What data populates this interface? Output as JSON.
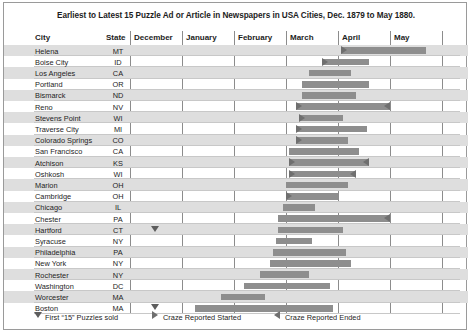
{
  "chart": {
    "title": "Earliest to Latest 15 Puzzle Ad or Article in Newspapers in USA Cities, Dec. 1879 to May 1880.",
    "columns": {
      "city": "City",
      "state": "State"
    },
    "months": [
      "December",
      "January",
      "February",
      "March",
      "April",
      "May"
    ]
  },
  "legend": [
    {
      "glyph": "triangle-down-icon",
      "label": "First “15” Puzzles sold"
    },
    {
      "glyph": "triangle-right-icon",
      "label": "Craze Reported Started"
    },
    {
      "glyph": "triangle-left-icon",
      "label": "Craze Reported Ended"
    }
  ],
  "chart_data": {
    "type": "bar",
    "orientation": "horizontal",
    "subtype": "gantt-timeline",
    "title": "Earliest to Latest 15 Puzzle Ad or Article in Newspapers in USA Cities, Dec. 1879 to May 1880.",
    "xlabel": "",
    "ylabel": "City",
    "x_axis_categories": [
      "December",
      "January",
      "February",
      "March",
      "April",
      "May"
    ],
    "x_axis_range_months": [
      "1879-12",
      "1880-05"
    ],
    "grid": true,
    "legend_position": "bottom-left",
    "value_units": "months (fractional, 0 = start of December 1879)",
    "markers": {
      "triangle_down": "First “15” Puzzles sold",
      "triangle_right": "Craze Reported Started",
      "triangle_left": "Craze Reported Ended"
    },
    "categories": [
      "Helena",
      "Boise City",
      "Los Angeles",
      "Portland",
      "Bismarck",
      "Reno",
      "Stevens Point",
      "Traverse City",
      "Colorado Springs",
      "San Francisco",
      "Atchison",
      "Oshkosh",
      "Marion",
      "Cambridge",
      "Chicago",
      "Chester",
      "Hartford",
      "Syracuse",
      "Philadelphia",
      "New York",
      "Rochester",
      "Washington",
      "Worcester",
      "Boston"
    ],
    "rows": [
      {
        "city": "Helena",
        "state": "MT",
        "start": 4.05,
        "end": 5.7,
        "start_marker": "triangle-right",
        "end_marker": null,
        "puzzle_sold_marker": null
      },
      {
        "city": "Boise City",
        "state": "ID",
        "start": 3.7,
        "end": 4.6,
        "start_marker": "triangle-right",
        "end_marker": null,
        "puzzle_sold_marker": null
      },
      {
        "city": "Los Angeles",
        "state": "CA",
        "start": 3.45,
        "end": 4.25,
        "start_marker": null,
        "end_marker": null,
        "puzzle_sold_marker": null
      },
      {
        "city": "Portland",
        "state": "OR",
        "start": 3.3,
        "end": 4.6,
        "start_marker": null,
        "end_marker": null,
        "puzzle_sold_marker": null
      },
      {
        "city": "Bismarck",
        "state": "ND",
        "start": 3.3,
        "end": 4.35,
        "start_marker": null,
        "end_marker": null,
        "puzzle_sold_marker": null
      },
      {
        "city": "Reno",
        "state": "NV",
        "start": 3.2,
        "end": 5.0,
        "start_marker": "triangle-right",
        "end_marker": "triangle-left",
        "puzzle_sold_marker": null
      },
      {
        "city": "Stevens Point",
        "state": "WI",
        "start": 3.25,
        "end": 4.1,
        "start_marker": "triangle-right",
        "end_marker": null,
        "puzzle_sold_marker": null
      },
      {
        "city": "Traverse City",
        "state": "MI",
        "start": 3.2,
        "end": 4.55,
        "start_marker": "triangle-right",
        "end_marker": null,
        "puzzle_sold_marker": null
      },
      {
        "city": "Colorado Springs",
        "state": "CO",
        "start": 3.2,
        "end": 4.2,
        "start_marker": "triangle-right",
        "end_marker": null,
        "puzzle_sold_marker": null
      },
      {
        "city": "San Francisco",
        "state": "CA",
        "start": 3.05,
        "end": 4.4,
        "start_marker": null,
        "end_marker": null,
        "puzzle_sold_marker": null
      },
      {
        "city": "Atchison",
        "state": "KS",
        "start": 3.05,
        "end": 4.6,
        "start_marker": "triangle-right",
        "end_marker": "triangle-left",
        "puzzle_sold_marker": null
      },
      {
        "city": "Oshkosh",
        "state": "WI",
        "start": 3.05,
        "end": 4.35,
        "start_marker": "triangle-right",
        "end_marker": "triangle-left",
        "puzzle_sold_marker": null
      },
      {
        "city": "Marion",
        "state": "OH",
        "start": 3.0,
        "end": 4.2,
        "start_marker": null,
        "end_marker": null,
        "puzzle_sold_marker": null
      },
      {
        "city": "Cambridge",
        "state": "OH",
        "start": 3.0,
        "end": 4.0,
        "start_marker": "triangle-right",
        "end_marker": null,
        "puzzle_sold_marker": null
      },
      {
        "city": "Chicago",
        "state": "IL",
        "start": 2.95,
        "end": 3.55,
        "start_marker": null,
        "end_marker": null,
        "puzzle_sold_marker": null
      },
      {
        "city": "Chester",
        "state": "PA",
        "start": 2.85,
        "end": 5.0,
        "start_marker": null,
        "end_marker": "triangle-left",
        "puzzle_sold_marker": null
      },
      {
        "city": "Hartford",
        "state": "CT",
        "start": 2.85,
        "end": 4.1,
        "start_marker": null,
        "end_marker": null,
        "puzzle_sold_marker": 0.5
      },
      {
        "city": "Syracuse",
        "state": "NY",
        "start": 2.8,
        "end": 3.5,
        "start_marker": null,
        "end_marker": null,
        "puzzle_sold_marker": null
      },
      {
        "city": "Philadelphia",
        "state": "PA",
        "start": 2.75,
        "end": 4.15,
        "start_marker": null,
        "end_marker": null,
        "puzzle_sold_marker": null
      },
      {
        "city": "New York",
        "state": "NY",
        "start": 2.7,
        "end": 4.25,
        "start_marker": null,
        "end_marker": null,
        "puzzle_sold_marker": null
      },
      {
        "city": "Rochester",
        "state": "NY",
        "start": 2.5,
        "end": 3.45,
        "start_marker": null,
        "end_marker": null,
        "puzzle_sold_marker": null
      },
      {
        "city": "Washington",
        "state": "DC",
        "start": 2.2,
        "end": 3.85,
        "start_marker": null,
        "end_marker": null,
        "puzzle_sold_marker": null
      },
      {
        "city": "Worcester",
        "state": "MA",
        "start": 1.75,
        "end": 2.6,
        "start_marker": null,
        "end_marker": null,
        "puzzle_sold_marker": null
      },
      {
        "city": "Boston",
        "state": "MA",
        "start": 1.25,
        "end": 3.9,
        "start_marker": null,
        "end_marker": null,
        "puzzle_sold_marker": 0.5
      }
    ]
  }
}
